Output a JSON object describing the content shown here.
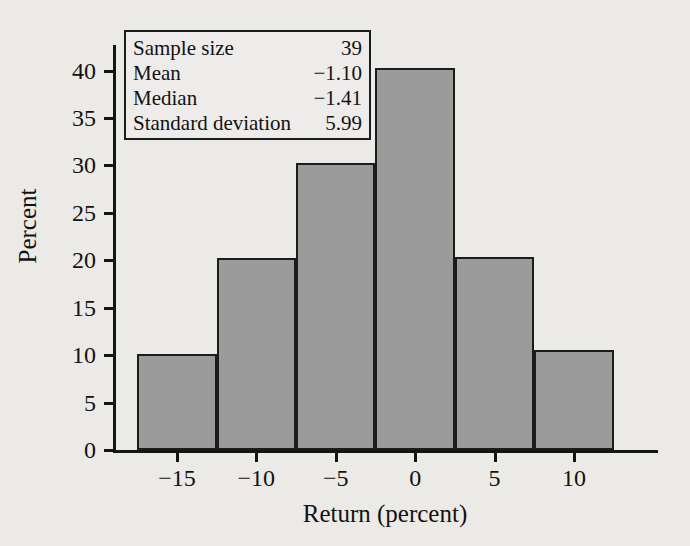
{
  "chart_data": {
    "type": "bar",
    "title": "",
    "subtitle": "",
    "xlabel": "Return (percent)",
    "ylabel": "Percent",
    "xlim": [
      -18.9,
      15.1
    ],
    "ylim": [
      0,
      42.7
    ],
    "grid": false,
    "legend": null,
    "bin_width": 5,
    "bin_edges": [
      -17.5,
      -12.5,
      -7.5,
      -2.5,
      2.5,
      7.5,
      12.5
    ],
    "categories": [
      "-17.5 to -12.5",
      "-12.5 to -7.5",
      "-7.5 to -2.5",
      "-2.5 to 2.5",
      "2.5 to 7.5",
      "7.5 to 12.5"
    ],
    "values": [
      10.1,
      20.2,
      30.3,
      40.3,
      20.3,
      10.5
    ],
    "xticks": [
      -15,
      -10,
      -5,
      0,
      5,
      10
    ],
    "xtick_labels": [
      "−15",
      "−10",
      "−5",
      "0",
      "5",
      "10"
    ],
    "yticks": [
      0,
      5,
      10,
      15,
      20,
      25,
      30,
      35,
      40
    ],
    "ytick_labels": [
      "0",
      "5",
      "10",
      "15",
      "20",
      "25",
      "30",
      "35",
      "40"
    ],
    "bar_fill_color": "#9b9b9b",
    "bar_edge_color": "#1c1c1c",
    "background_color": "#eceae7"
  },
  "stats_box": {
    "rows": [
      {
        "label": "Sample size",
        "value": "39"
      },
      {
        "label": "Mean",
        "value": "−1.10"
      },
      {
        "label": "Median",
        "value": "−1.41"
      },
      {
        "label": "Standard deviation",
        "value": "5.99"
      }
    ]
  }
}
